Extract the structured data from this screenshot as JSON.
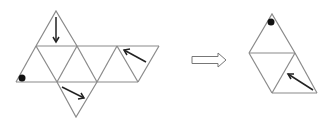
{
  "diagram": {
    "colors": {
      "line": "#8a8a8a",
      "arrow": "#222222",
      "dot": "#111111",
      "background": "#ffffff"
    },
    "left_net": {
      "label": "octahedron-net",
      "markings": [
        {
          "type": "arrow",
          "face": "top",
          "direction": "down"
        },
        {
          "type": "dot",
          "face": "left-bottom",
          "position": "bottom-left corner"
        },
        {
          "type": "arrow",
          "face": "right",
          "direction": "up-left"
        },
        {
          "type": "arrow",
          "face": "bottom",
          "direction": "down-right"
        }
      ]
    },
    "transition_arrow": {
      "label": "hollow-right-arrow"
    },
    "right_view": {
      "label": "folded-view",
      "markings": [
        {
          "type": "dot",
          "face": "top",
          "position": "apex"
        },
        {
          "type": "arrow",
          "face": "bottom-right",
          "direction": "up-left"
        }
      ]
    }
  }
}
